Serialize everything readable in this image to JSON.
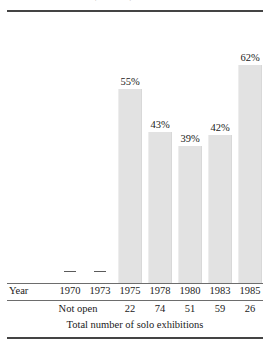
{
  "figure": {
    "clipped_title": "Attendance at the Whitney Museum, 1970–1985",
    "caption": "Total number of solo exhibitions",
    "year_row_header": "Year",
    "not_open_label": "Not open",
    "no_data_marker": "—",
    "bar_color": "#e2e2e2",
    "rule_color": "#444444"
  },
  "chart_data": {
    "type": "bar",
    "title": "",
    "xlabel": "Year",
    "ylabel": "",
    "categories": [
      "1970",
      "1973",
      "1975",
      "1978",
      "1980",
      "1983",
      "1985"
    ],
    "values": [
      null,
      null,
      55,
      43,
      39,
      42,
      62
    ],
    "value_labels": [
      "",
      "",
      "55%",
      "43%",
      "39%",
      "42%",
      "62%"
    ],
    "ylim": [
      0,
      70
    ],
    "grid": false,
    "legend": "none",
    "annotations": [
      "Not open"
    ],
    "table": {
      "row_header": "Year",
      "columns": [
        "1970",
        "1973",
        "1975",
        "1978",
        "1980",
        "1983",
        "1985"
      ],
      "counts": [
        "",
        "",
        "22",
        "74",
        "51",
        "59",
        "26"
      ],
      "counts_note": "Not open",
      "caption": "Total number of solo exhibitions"
    }
  },
  "columns": [
    {
      "year": "1970",
      "pct": "",
      "count": "",
      "no_data": true
    },
    {
      "year": "1973",
      "pct": "",
      "count": "",
      "no_data": true
    },
    {
      "year": "1975",
      "pct": "55%",
      "count": "22",
      "no_data": false
    },
    {
      "year": "1978",
      "pct": "43%",
      "count": "74",
      "no_data": false
    },
    {
      "year": "1980",
      "pct": "39%",
      "count": "51",
      "no_data": false
    },
    {
      "year": "1983",
      "pct": "42%",
      "count": "59",
      "no_data": false
    },
    {
      "year": "1985",
      "pct": "62%",
      "count": "26",
      "no_data": false
    }
  ]
}
